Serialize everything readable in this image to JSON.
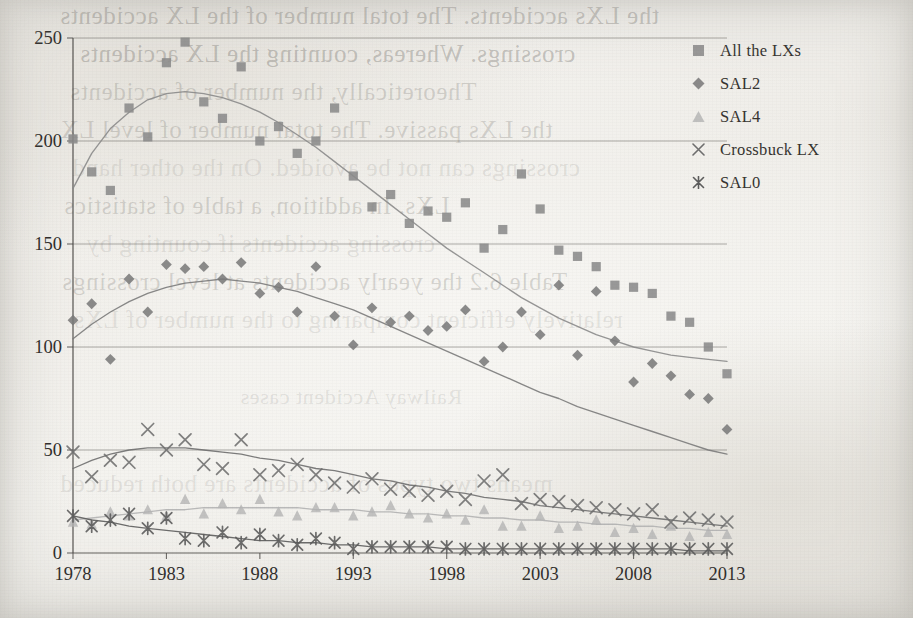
{
  "chart_data": {
    "type": "scatter",
    "title": "",
    "xlabel": "",
    "ylabel": "",
    "xlim": [
      1978,
      2013
    ],
    "ylim": [
      0,
      250
    ],
    "yticks": [
      0,
      50,
      100,
      150,
      200,
      250
    ],
    "xticks": [
      1978,
      1983,
      1988,
      1993,
      1998,
      2003,
      2008,
      2013
    ],
    "grid": "horizontal",
    "legend_position": "right",
    "has_trend_curves": true,
    "x": [
      1978,
      1979,
      1980,
      1981,
      1982,
      1983,
      1984,
      1985,
      1986,
      1987,
      1988,
      1989,
      1990,
      1991,
      1992,
      1993,
      1994,
      1995,
      1996,
      1997,
      1998,
      1999,
      2000,
      2001,
      2002,
      2003,
      2004,
      2005,
      2006,
      2007,
      2008,
      2009,
      2010,
      2011,
      2012,
      2013
    ],
    "series": [
      {
        "name": "All  the LXs",
        "marker": "square",
        "color": "#8b8b8b",
        "values": [
          201,
          185,
          176,
          216,
          202,
          238,
          248,
          219,
          211,
          236,
          200,
          207,
          194,
          200,
          216,
          183,
          168,
          174,
          160,
          166,
          163,
          170,
          148,
          157,
          184,
          167,
          147,
          144,
          139,
          130,
          129,
          126,
          115,
          112,
          100,
          87
        ]
      },
      {
        "name": "SAL2",
        "marker": "diamond",
        "color": "#7b7b7b",
        "values": [
          113,
          121,
          94,
          133,
          117,
          140,
          138,
          139,
          133,
          141,
          126,
          129,
          117,
          139,
          115,
          101,
          119,
          112,
          115,
          108,
          110,
          118,
          93,
          100,
          117,
          106,
          130,
          96,
          127,
          103,
          83,
          92,
          86,
          77,
          75,
          60
        ]
      },
      {
        "name": "SAL4",
        "marker": "triangle",
        "color": "#b3b3b3",
        "values": [
          15,
          14,
          20,
          18,
          21,
          18,
          26,
          19,
          24,
          21,
          26,
          20,
          18,
          22,
          22,
          18,
          20,
          23,
          19,
          17,
          19,
          16,
          21,
          13,
          13,
          18,
          12,
          13,
          16,
          10,
          12,
          9,
          13,
          8,
          10,
          9
        ]
      },
      {
        "name": "Crossbuck LX",
        "marker": "cross",
        "color": "#6e6e6e",
        "values": [
          49,
          37,
          45,
          44,
          60,
          50,
          55,
          43,
          41,
          55,
          38,
          40,
          43,
          38,
          34,
          32,
          36,
          31,
          30,
          28,
          30,
          26,
          35,
          38,
          24,
          26,
          25,
          23,
          22,
          21,
          19,
          21,
          15,
          17,
          16,
          15
        ]
      },
      {
        "name": "SAL0",
        "marker": "asterisk",
        "color": "#5c5c5c",
        "values": [
          18,
          13,
          16,
          19,
          12,
          17,
          7,
          6,
          10,
          5,
          9,
          6,
          4,
          7,
          5,
          2,
          3,
          3,
          3,
          3,
          3,
          2,
          2,
          2,
          2,
          2,
          2,
          2,
          2,
          2,
          2,
          2,
          2,
          2,
          2,
          2
        ]
      }
    ],
    "trends": [
      {
        "name": "All  the LXs",
        "points": [
          [
            1978,
            177
          ],
          [
            1979,
            194
          ],
          [
            1980,
            206
          ],
          [
            1981,
            214
          ],
          [
            1982,
            220
          ],
          [
            1983,
            223
          ],
          [
            1984,
            224
          ],
          [
            1985,
            223
          ],
          [
            1986,
            221
          ],
          [
            1987,
            218
          ],
          [
            1988,
            214
          ],
          [
            1989,
            209
          ],
          [
            1990,
            203
          ],
          [
            1991,
            197
          ],
          [
            1992,
            190
          ],
          [
            1993,
            183
          ],
          [
            1994,
            176
          ],
          [
            1995,
            169
          ],
          [
            1996,
            162
          ],
          [
            1997,
            155
          ],
          [
            1998,
            148
          ],
          [
            1999,
            142
          ],
          [
            2000,
            136
          ],
          [
            2001,
            130
          ],
          [
            2002,
            124
          ],
          [
            2003,
            119
          ],
          [
            2004,
            114
          ],
          [
            2005,
            110
          ],
          [
            2006,
            106
          ],
          [
            2007,
            103
          ],
          [
            2008,
            100
          ],
          [
            2009,
            98
          ],
          [
            2010,
            96
          ],
          [
            2011,
            95
          ],
          [
            2012,
            94
          ],
          [
            2013,
            93
          ]
        ]
      },
      {
        "name": "SAL2",
        "points": [
          [
            1978,
            104
          ],
          [
            1979,
            111
          ],
          [
            1980,
            117
          ],
          [
            1981,
            122
          ],
          [
            1982,
            126
          ],
          [
            1983,
            129
          ],
          [
            1984,
            131
          ],
          [
            1985,
            132
          ],
          [
            1986,
            133
          ],
          [
            1987,
            132
          ],
          [
            1988,
            131
          ],
          [
            1989,
            129
          ],
          [
            1990,
            127
          ],
          [
            1991,
            124
          ],
          [
            1992,
            121
          ],
          [
            1993,
            118
          ],
          [
            1994,
            114
          ],
          [
            1995,
            110
          ],
          [
            1996,
            106
          ],
          [
            1997,
            102
          ],
          [
            1998,
            98
          ],
          [
            1999,
            94
          ],
          [
            2000,
            90
          ],
          [
            2001,
            86
          ],
          [
            2002,
            82
          ],
          [
            2003,
            78
          ],
          [
            2004,
            75
          ],
          [
            2005,
            71
          ],
          [
            2006,
            68
          ],
          [
            2007,
            65
          ],
          [
            2008,
            62
          ],
          [
            2009,
            59
          ],
          [
            2010,
            56
          ],
          [
            2011,
            53
          ],
          [
            2012,
            50
          ],
          [
            2013,
            48
          ]
        ]
      },
      {
        "name": "SAL4",
        "points": [
          [
            1978,
            16
          ],
          [
            1979,
            17
          ],
          [
            1980,
            18
          ],
          [
            1981,
            19
          ],
          [
            1982,
            20
          ],
          [
            1983,
            21
          ],
          [
            1984,
            21
          ],
          [
            1985,
            22
          ],
          [
            1986,
            22
          ],
          [
            1987,
            22
          ],
          [
            1988,
            22
          ],
          [
            1989,
            22
          ],
          [
            1990,
            22
          ],
          [
            1991,
            21
          ],
          [
            1992,
            21
          ],
          [
            1993,
            21
          ],
          [
            1994,
            20
          ],
          [
            1995,
            20
          ],
          [
            1996,
            19
          ],
          [
            1997,
            19
          ],
          [
            1998,
            18
          ],
          [
            1999,
            18
          ],
          [
            2000,
            17
          ],
          [
            2001,
            17
          ],
          [
            2002,
            16
          ],
          [
            2003,
            16
          ],
          [
            2004,
            15
          ],
          [
            2005,
            15
          ],
          [
            2006,
            14
          ],
          [
            2007,
            14
          ],
          [
            2008,
            13
          ],
          [
            2009,
            13
          ],
          [
            2010,
            12
          ],
          [
            2011,
            12
          ],
          [
            2012,
            11
          ],
          [
            2013,
            11
          ]
        ]
      },
      {
        "name": "Crossbuck LX",
        "points": [
          [
            1978,
            41
          ],
          [
            1979,
            45
          ],
          [
            1980,
            48
          ],
          [
            1981,
            50
          ],
          [
            1982,
            51
          ],
          [
            1983,
            51
          ],
          [
            1984,
            51
          ],
          [
            1985,
            50
          ],
          [
            1986,
            49
          ],
          [
            1987,
            48
          ],
          [
            1988,
            46
          ],
          [
            1989,
            45
          ],
          [
            1990,
            43
          ],
          [
            1991,
            41
          ],
          [
            1992,
            40
          ],
          [
            1993,
            38
          ],
          [
            1994,
            36
          ],
          [
            1995,
            35
          ],
          [
            1996,
            33
          ],
          [
            1997,
            32
          ],
          [
            1998,
            30
          ],
          [
            1999,
            29
          ],
          [
            2000,
            27
          ],
          [
            2001,
            26
          ],
          [
            2002,
            25
          ],
          [
            2003,
            23
          ],
          [
            2004,
            22
          ],
          [
            2005,
            21
          ],
          [
            2006,
            20
          ],
          [
            2007,
            19
          ],
          [
            2008,
            18
          ],
          [
            2009,
            17
          ],
          [
            2010,
            16
          ],
          [
            2011,
            15
          ],
          [
            2012,
            14
          ],
          [
            2013,
            13
          ]
        ]
      },
      {
        "name": "SAL0",
        "points": [
          [
            1978,
            18
          ],
          [
            1979,
            16
          ],
          [
            1980,
            15
          ],
          [
            1981,
            13
          ],
          [
            1982,
            12
          ],
          [
            1983,
            11
          ],
          [
            1984,
            10
          ],
          [
            1985,
            9
          ],
          [
            1986,
            8
          ],
          [
            1987,
            7
          ],
          [
            1988,
            6
          ],
          [
            1989,
            6
          ],
          [
            1990,
            5
          ],
          [
            1991,
            5
          ],
          [
            1992,
            4
          ],
          [
            1993,
            4
          ],
          [
            1994,
            3
          ],
          [
            1995,
            3
          ],
          [
            1996,
            3
          ],
          [
            1997,
            3
          ],
          [
            1998,
            2
          ],
          [
            1999,
            2
          ],
          [
            2000,
            2
          ],
          [
            2001,
            2
          ],
          [
            2002,
            2
          ],
          [
            2003,
            2
          ],
          [
            2004,
            2
          ],
          [
            2005,
            2
          ],
          [
            2006,
            2
          ],
          [
            2007,
            2
          ],
          [
            2008,
            2
          ],
          [
            2009,
            2
          ],
          [
            2010,
            2
          ],
          [
            2011,
            1
          ],
          [
            2012,
            1
          ],
          [
            2013,
            1
          ]
        ]
      }
    ]
  },
  "legend": {
    "items": [
      {
        "label": "All  the LXs",
        "marker": "square-marker-icon"
      },
      {
        "label": "SAL2",
        "marker": "diamond-marker-icon"
      },
      {
        "label": "SAL4",
        "marker": "triangle-marker-icon"
      },
      {
        "label": "Crossbuck LX",
        "marker": "cross-marker-icon"
      },
      {
        "label": "SAL0",
        "marker": "asterisk-marker-icon"
      }
    ]
  },
  "axes": {
    "y_tick_labels": [
      "250",
      "200",
      "150",
      "100",
      "50",
      "0"
    ],
    "x_tick_labels": [
      "1978",
      "1983",
      "1988",
      "1993",
      "1998",
      "2003",
      "2008",
      "2013"
    ]
  },
  "page_bleed_through": {
    "lines": [
      "the LXs accidents. The total number of the LX accidents",
      "crossings. Whereas, counting the LX accidents",
      "Theoretically, the number of accidents",
      "the LXs passive. The total number of level LX",
      "crossings can not be avoided. On the other hand",
      "LXs. In addition, a table of statistics",
      "crossing accidents if counting by",
      "Table 6.2 the yearly accidents at level crossings",
      "relatively efficient comparing to the number of LXs",
      "means two types of accidents are both reduced"
    ],
    "caption": "Railway Accident cases"
  },
  "colors": {
    "page_background": "#f2f1ee",
    "axis": "#4a4845",
    "gridline": "#6f6d69",
    "series_all_lxs": "#8b8b8b",
    "series_sal2": "#7b7b7b",
    "series_sal4": "#b3b3b3",
    "series_crossbuck": "#6e6e6e",
    "series_sal0": "#5c5c5c"
  }
}
